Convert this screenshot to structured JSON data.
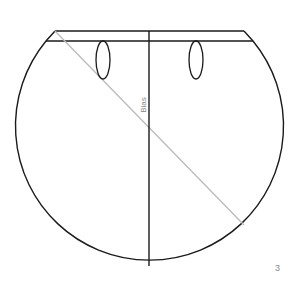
{
  "diagram": {
    "label": "Bias",
    "page_number": "3",
    "colors": {
      "outline": "#1a1a1a",
      "bias_line": "#bbbbbb",
      "label": "#888888"
    },
    "shapes": {
      "waistband": {
        "top_y": 31,
        "bottom_y": 41,
        "top_left_x": 55,
        "top_right_x": 244,
        "bottom_left_x": 46,
        "bottom_right_x": 253
      },
      "circle": {
        "cx": 149.5,
        "cy": 132,
        "r": 134
      },
      "center_line": {
        "x": 149,
        "y1": 31,
        "y2": 266
      },
      "bias_line": {
        "x1": 55,
        "y1": 31,
        "x2": 244,
        "y2": 225
      },
      "buttonholes": [
        {
          "cx": 103,
          "cy": 60,
          "rx": 7,
          "ry": 19
        },
        {
          "cx": 196,
          "cy": 60,
          "rx": 7,
          "ry": 19
        }
      ]
    }
  }
}
